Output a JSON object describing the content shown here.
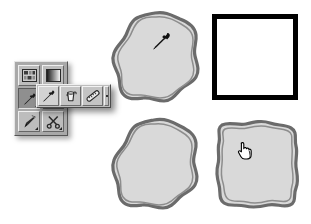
{
  "app": {
    "title": "Image Editor Tool Flyout",
    "background_color": "#ffffff"
  },
  "palette": {
    "shape_fill": "#d9d9d9",
    "shape_stroke": "#6b6b6b",
    "square_stroke": "#000000",
    "square_fill": "#ffffff",
    "toolbar_face": "#bdbdbd",
    "toolbar_shadow": "#a8a8a8",
    "selected_face": "#8f8f8f",
    "cursor_color": "#000000"
  },
  "toolbar": {
    "name": "tool-palette",
    "columns": 2,
    "rows": [
      {
        "cells": [
          {
            "id": "tool-pattern-stamp",
            "icon": "pattern-stamp-icon",
            "label": "Pattern Stamp Tool",
            "selected": false,
            "has_flyout": false
          },
          {
            "id": "tool-gradient",
            "icon": "gradient-icon",
            "label": "Gradient Tool",
            "selected": false,
            "has_flyout": false
          }
        ]
      },
      {
        "cells": [
          {
            "id": "tool-eyedropper",
            "icon": "eyedropper-icon",
            "label": "Eyedropper Tool",
            "selected": true,
            "has_flyout": true
          },
          {
            "id": "tool-hidden-right",
            "icon": "blank-icon",
            "label": "",
            "selected": false,
            "has_flyout": false
          }
        ]
      },
      {
        "cells": [
          {
            "id": "tool-dagger",
            "icon": "dagger-icon",
            "label": "Sharpen Tool",
            "selected": false,
            "has_flyout": true
          },
          {
            "id": "tool-scissors",
            "icon": "scissors-icon",
            "label": "Scissors Tool",
            "selected": false,
            "has_flyout": true
          }
        ]
      }
    ]
  },
  "flyout": {
    "name": "eyedropper-flyout-menu",
    "open": true,
    "items": [
      {
        "id": "flyout-eyedropper",
        "icon": "eyedropper-icon",
        "label": "Eyedropper Tool",
        "active": true
      },
      {
        "id": "flyout-color-sampler",
        "icon": "paint-bucket-icon",
        "label": "Color Sampler Tool",
        "active": false
      },
      {
        "id": "flyout-measure",
        "icon": "ruler-icon",
        "label": "Measure Tool",
        "active": false
      }
    ],
    "end_cap": {
      "id": "flyout-end-cap",
      "icon": "flyout-handle-icon"
    }
  },
  "canvas": {
    "name": "illustration-canvas",
    "shapes": [
      {
        "id": "shape-circle-top",
        "kind": "hand-drawn-circle",
        "label": "Wobbly circle with eyedropper cursor",
        "x": 110,
        "y": 10,
        "w": 92,
        "h": 95,
        "fill": "#d9d9d9",
        "stroke": "#6b6b6b",
        "cursor": {
          "id": "cursor-eyedropper",
          "icon": "eyedropper-cursor-icon",
          "x": 150,
          "y": 30
        }
      },
      {
        "id": "shape-square-top",
        "kind": "clean-square",
        "label": "Crisp black-bordered white square",
        "x": 212,
        "y": 14,
        "w": 86,
        "h": 86,
        "fill": "#ffffff",
        "stroke": "#000000",
        "cursor": null
      },
      {
        "id": "shape-circle-bottom",
        "kind": "hand-drawn-circle",
        "label": "Wobbly circle, no cursor",
        "x": 110,
        "y": 116,
        "w": 92,
        "h": 96,
        "fill": "#d9d9d9",
        "stroke": "#6b6b6b",
        "cursor": null
      },
      {
        "id": "shape-square-bottom",
        "kind": "hand-drawn-square",
        "label": "Wobbly square with pointing-hand cursor",
        "x": 212,
        "y": 117,
        "w": 90,
        "h": 94,
        "fill": "#d9d9d9",
        "stroke": "#6b6b6b",
        "cursor": {
          "id": "cursor-hand",
          "icon": "pointing-hand-cursor-icon",
          "x": 236,
          "y": 141
        }
      }
    ]
  }
}
